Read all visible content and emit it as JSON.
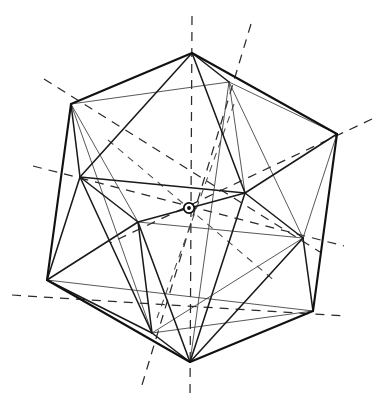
{
  "figure": {
    "kind": "geometric-line-drawing",
    "canvas": {
      "width": 384,
      "height": 408,
      "background": "#ffffff"
    },
    "colors": {
      "outer_edge": "#111111",
      "front_edge": "#1a1a1a",
      "back_edge": "#3a3a3a",
      "axis": "#2b2b2b",
      "center_marker": "#0d0d0d"
    },
    "center_marker": {
      "name": "symmetry-center",
      "x": 189,
      "y": 208,
      "outer_radius": 5.2,
      "inner_radius": 1.9
    },
    "vertices": [
      {
        "id": "V1",
        "label": "top",
        "x": 192,
        "y": 53
      },
      {
        "id": "V2",
        "label": "upper-left",
        "x": 71,
        "y": 104
      },
      {
        "id": "V3",
        "label": "upper-inner-right",
        "x": 229,
        "y": 82
      },
      {
        "id": "V4",
        "label": "upper-right",
        "x": 337,
        "y": 134
      },
      {
        "id": "V5",
        "label": "mid-left",
        "x": 80,
        "y": 177
      },
      {
        "id": "V6",
        "label": "mid-inner-right",
        "x": 245,
        "y": 193
      },
      {
        "id": "V7",
        "label": "mid-inner-left",
        "x": 138,
        "y": 222
      },
      {
        "id": "V8",
        "label": "mid-right",
        "x": 303,
        "y": 238
      },
      {
        "id": "V9",
        "label": "lower-left",
        "x": 47,
        "y": 280
      },
      {
        "id": "V10",
        "label": "lower-inner-left",
        "x": 152,
        "y": 333
      },
      {
        "id": "V11",
        "label": "lower-right",
        "x": 313,
        "y": 311
      },
      {
        "id": "V12",
        "label": "bottom",
        "x": 190,
        "y": 362
      }
    ],
    "outer_silhouette": [
      {
        "from": "V1",
        "to": "V2"
      },
      {
        "from": "V2",
        "to": "V9"
      },
      {
        "from": "V9",
        "to": "V12"
      },
      {
        "from": "V12",
        "to": "V11"
      },
      {
        "from": "V11",
        "to": "V4"
      },
      {
        "from": "V4",
        "to": "V1"
      }
    ],
    "front_edges": [
      {
        "from": "V1",
        "to": "V5"
      },
      {
        "from": "V1",
        "to": "V6"
      },
      {
        "from": "V1",
        "to": "V3"
      },
      {
        "from": "V2",
        "to": "V5"
      },
      {
        "from": "V5",
        "to": "V9"
      },
      {
        "from": "V5",
        "to": "V6"
      },
      {
        "from": "V5",
        "to": "V7"
      },
      {
        "from": "V5",
        "to": "V10"
      },
      {
        "from": "V6",
        "to": "V4"
      },
      {
        "from": "V6",
        "to": "V8"
      },
      {
        "from": "V6",
        "to": "V7"
      },
      {
        "from": "V6",
        "to": "V12"
      },
      {
        "from": "V7",
        "to": "V9"
      },
      {
        "from": "V7",
        "to": "V10"
      },
      {
        "from": "V7",
        "to": "V12"
      },
      {
        "from": "V8",
        "to": "V11"
      },
      {
        "from": "V8",
        "to": "V12"
      },
      {
        "from": "V9",
        "to": "V10"
      },
      {
        "from": "V10",
        "to": "V12"
      }
    ],
    "back_edges": [
      {
        "from": "V2",
        "to": "V3"
      },
      {
        "from": "V3",
        "to": "V4"
      },
      {
        "from": "V2",
        "to": "V7"
      },
      {
        "from": "V3",
        "to": "V6"
      },
      {
        "from": "V3",
        "to": "V8"
      },
      {
        "from": "V4",
        "to": "V8"
      },
      {
        "from": "V7",
        "to": "V8"
      },
      {
        "from": "V8",
        "to": "V10"
      },
      {
        "from": "V9",
        "to": "V11"
      },
      {
        "from": "V10",
        "to": "V11"
      },
      {
        "from": "V2",
        "to": "V10"
      },
      {
        "from": "V3",
        "to": "V12"
      }
    ],
    "axes": [
      {
        "id": "A1",
        "label": "vertical-axis",
        "x1": 192,
        "y1": 16,
        "x2": 190,
        "y2": 396,
        "weight": "long"
      },
      {
        "id": "A2",
        "label": "axis-upper-left",
        "x1": 44,
        "y1": 79,
        "x2": 320,
        "y2": 252,
        "weight": "long"
      },
      {
        "id": "A3",
        "label": "axis-upper-right",
        "x1": 372,
        "y1": 119,
        "x2": 110,
        "y2": 243,
        "weight": "long"
      },
      {
        "id": "A4",
        "label": "axis-left-low",
        "x1": 33,
        "y1": 166,
        "x2": 344,
        "y2": 246,
        "weight": "long"
      },
      {
        "id": "A5",
        "label": "axis-diag-ne",
        "x1": 251,
        "y1": 24,
        "x2": 142,
        "y2": 385,
        "weight": "long"
      },
      {
        "id": "A6",
        "label": "axis-diag-sw",
        "x1": 12,
        "y1": 295,
        "x2": 345,
        "y2": 316,
        "weight": "long"
      },
      {
        "id": "A7",
        "label": "axis-short-a",
        "x1": 108,
        "y1": 140,
        "x2": 276,
        "y2": 282,
        "weight": "short"
      },
      {
        "id": "A8",
        "label": "axis-short-b",
        "x1": 234,
        "y1": 104,
        "x2": 157,
        "y2": 318,
        "weight": "short"
      }
    ]
  }
}
